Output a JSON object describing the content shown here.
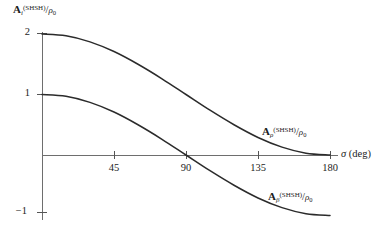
{
  "chart_data": {
    "type": "line",
    "title": "",
    "xlabel": "σ (deg)",
    "ylabel": "A_i^(SHSH)/ρ₀",
    "xlim": [
      0,
      180
    ],
    "ylim": [
      -1,
      2
    ],
    "xticks": [
      45,
      90,
      135,
      180
    ],
    "yticks": [
      2,
      1,
      -1
    ],
    "grid": false,
    "legend_position": "inline-curve-labels",
    "series": [
      {
        "name": "A_ρ^(SHSH)/ρ₀",
        "formula": "1 + cos(sigma)",
        "x": [
          0,
          15,
          30,
          45,
          60,
          75,
          90,
          105,
          120,
          135,
          150,
          165,
          180
        ],
        "values": [
          2.0,
          1.97,
          1.87,
          1.71,
          1.5,
          1.26,
          1.0,
          0.74,
          0.5,
          0.29,
          0.13,
          0.03,
          0.0
        ]
      },
      {
        "name": "A_β^(SHSH)/ρ₀",
        "formula": "cos(sigma)",
        "x": [
          0,
          15,
          30,
          45,
          60,
          75,
          90,
          105,
          120,
          135,
          150,
          165,
          180
        ],
        "values": [
          1.0,
          0.97,
          0.87,
          0.71,
          0.5,
          0.26,
          0.0,
          -0.26,
          -0.5,
          -0.71,
          -0.87,
          -0.97,
          -1.0
        ]
      }
    ],
    "colors": {
      "curve": "#2b2b2b",
      "axis": "#6e6e6e",
      "background": "#ffffff"
    }
  },
  "axes": {
    "y_label": {
      "symbol": "A",
      "subscript": "i",
      "superscript": "(SHSH)",
      "slash": "/",
      "denominator": "ρ",
      "denominator_sub": "0"
    },
    "x_title": {
      "symbol": "σ",
      "unit": "(deg)"
    },
    "y_ticks": [
      {
        "label": "2"
      },
      {
        "label": "1"
      },
      {
        "label": "−1"
      }
    ],
    "x_ticks": [
      {
        "label": "45"
      },
      {
        "label": "90"
      },
      {
        "label": "135"
      },
      {
        "label": "180"
      }
    ]
  },
  "curve_labels": {
    "upper": {
      "symbol": "A",
      "subscript": "ρ",
      "superscript": "(SHSH)",
      "slash": "/",
      "denominator": "ρ",
      "denominator_sub": "0"
    },
    "lower": {
      "symbol": "A",
      "subscript": "β",
      "superscript": "(SHSH)",
      "slash": "/",
      "denominator": "ρ",
      "denominator_sub": "0"
    }
  }
}
